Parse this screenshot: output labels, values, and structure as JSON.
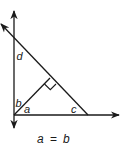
{
  "diagram": {
    "type": "geometry-angles",
    "stroke_color": "#1a1a1a",
    "background": "#ffffff",
    "angle_labels": {
      "d": "d",
      "b": "b",
      "a": "a",
      "c": "c"
    },
    "caption": {
      "left": "a",
      "op": "=",
      "right": "b"
    },
    "elements": [
      {
        "name": "vertical-line",
        "arrows": "both"
      },
      {
        "name": "horizontal-line",
        "arrows": "right"
      },
      {
        "name": "diagonal-line",
        "arrows": "top-left"
      },
      {
        "name": "perpendicular-segment",
        "right_angle_marker": true
      }
    ]
  }
}
